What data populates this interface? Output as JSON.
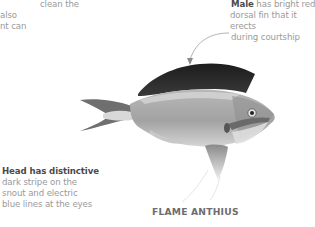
{
  "annotations": {
    "top_left": {
      "lines": [
        "clean the",
        "also",
        "nt can"
      ]
    },
    "male": {
      "bold": "Male",
      "rest_line1": " has bright red",
      "line2": "dorsal fin that it erects",
      "line3": "during courtship"
    },
    "head": {
      "bold": "Head has distinctive",
      "line2": "dark stripe on the",
      "line3": "snout and electric",
      "line4": "blue lines at the eyes"
    }
  },
  "title": "FLAME ANTHIUS",
  "colors": {
    "text_muted": "#9a9a9a",
    "text_bold": "#4a4a4a",
    "title": "#6e6e6e",
    "leader_line": "#a0a0a0"
  }
}
